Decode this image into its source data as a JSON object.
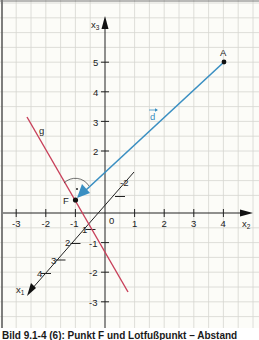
{
  "figure": {
    "axes": {
      "x2": {
        "label": "x",
        "subscript": "2",
        "ticks": [
          "-3",
          "-2",
          "-1",
          "1",
          "2",
          "3",
          "4"
        ],
        "origin_label": "0"
      },
      "x3": {
        "label": "x",
        "subscript": "3",
        "ticks": [
          "5",
          "4",
          "3",
          "2",
          "-1",
          "-2",
          "-3"
        ]
      },
      "x1": {
        "label": "x",
        "subscript": "1",
        "ticks": [
          "1",
          "2",
          "3",
          "4"
        ],
        "neg_tick": "-2"
      }
    },
    "points": {
      "A": {
        "label": "A",
        "coords": "(4, 5)"
      },
      "F": {
        "label": "F"
      }
    },
    "line_g": {
      "label": "g",
      "color": "#c8405a"
    },
    "vector_d": {
      "label": "d",
      "arrow_glyph": "→",
      "color": "#3a8fc2"
    },
    "right_angle_dot": "·"
  },
  "caption": "Bild 9.1-4 (6): Punkt F und Lotfußpunkt – Abstand"
}
